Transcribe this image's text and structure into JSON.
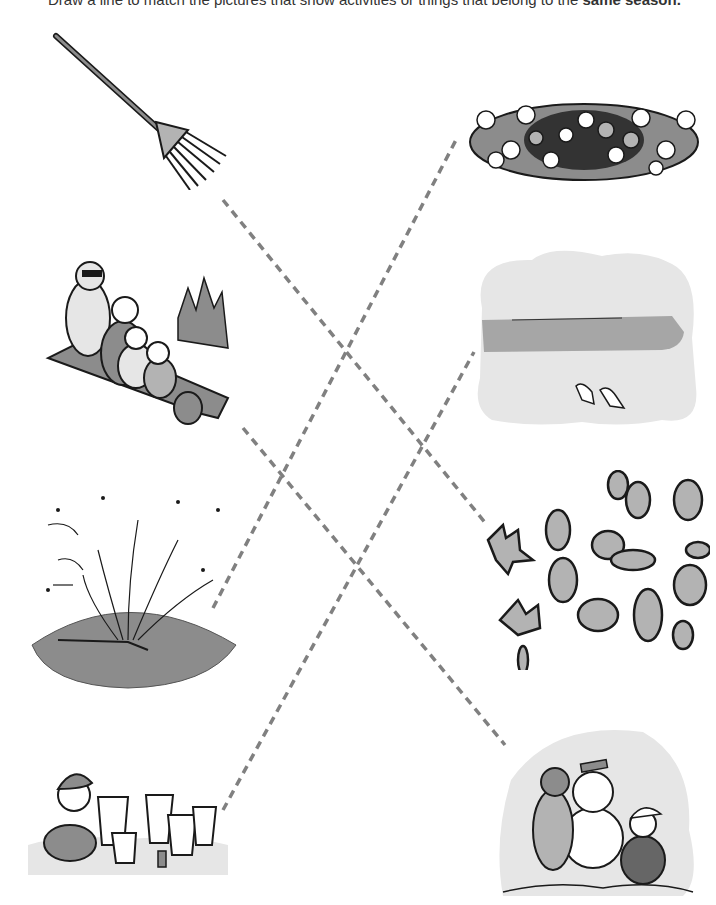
{
  "worksheet": {
    "instruction_prefix": "Draw a line to match the pictures that show activities or things that belong to the",
    "instruction_emphasis": "same season.",
    "left_column": [
      {
        "id": "rake",
        "label": "Rake",
        "season": "fall"
      },
      {
        "id": "sledding",
        "label": "Family sledding",
        "season": "winter"
      },
      {
        "id": "sprinkler",
        "label": "Lawn sprinkler",
        "season": "summer"
      },
      {
        "id": "sandcastle",
        "label": "Child building sandcastles",
        "season": "summer"
      }
    ],
    "right_column": [
      {
        "id": "flowers",
        "label": "Flowering bush",
        "season": "spring/summer"
      },
      {
        "id": "beach",
        "label": "Beach with seagulls",
        "season": "summer"
      },
      {
        "id": "leaves",
        "label": "Falling leaves",
        "season": "fall"
      },
      {
        "id": "snowman",
        "label": "Children building a snowman",
        "season": "winter"
      }
    ],
    "matches": [
      {
        "from": "rake",
        "to": "leaves",
        "x1": 223,
        "y1": 200,
        "x2": 487,
        "y2": 525
      },
      {
        "from": "sprinkler",
        "to": "flowers",
        "x1": 213,
        "y1": 608,
        "x2": 456,
        "y2": 140
      },
      {
        "from": "sledding",
        "to": "snowman",
        "x1": 243,
        "y1": 428,
        "x2": 505,
        "y2": 745
      },
      {
        "from": "sandcastle",
        "to": "beach",
        "x1": 223,
        "y1": 810,
        "x2": 474,
        "y2": 352
      }
    ],
    "colors": {
      "line": "#808080",
      "fill_light": "#e6e6e6",
      "fill_mid": "#b3b3b3",
      "fill_dark": "#8c8c8c",
      "ink": "#1a1a1a"
    }
  }
}
